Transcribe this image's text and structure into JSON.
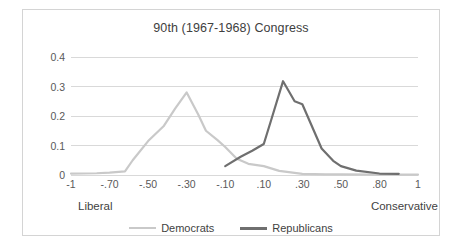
{
  "chart_data": {
    "type": "line",
    "title": "90th (1967-1968) Congress",
    "xlabel": "",
    "ylabel": "",
    "ylim": [
      0,
      0.4
    ],
    "ytick_labels": [
      "0.4",
      "0.3",
      "0.2",
      "0.1",
      "0"
    ],
    "ytick_values": [
      0.4,
      0.3,
      0.2,
      0.1,
      0
    ],
    "categories": [
      "-1",
      "-.70",
      "-.50",
      "-.30",
      "-.10",
      ".10",
      ".30",
      ".50",
      ".80",
      "1"
    ],
    "x": [
      -1,
      -0.7,
      -0.5,
      -0.3,
      -0.1,
      0.1,
      0.3,
      0.5,
      0.8,
      1
    ],
    "grid": "horizontal",
    "legend_position": "bottom",
    "annotations": {
      "left_pole": "Liberal",
      "right_pole": "Conservative"
    },
    "series": [
      {
        "name": "Democrats",
        "color": "#c9c9c9",
        "values": [
          0.005,
          0.008,
          0.115,
          0.28,
          0.095,
          0.03,
          0.004,
          0.002,
          0.001,
          0.001
        ],
        "points": [
          {
            "x": -1.0,
            "y": 0.005
          },
          {
            "x": -0.8,
            "y": 0.006
          },
          {
            "x": -0.7,
            "y": 0.008
          },
          {
            "x": -0.62,
            "y": 0.012
          },
          {
            "x": -0.58,
            "y": 0.05
          },
          {
            "x": -0.5,
            "y": 0.115
          },
          {
            "x": -0.42,
            "y": 0.165
          },
          {
            "x": -0.36,
            "y": 0.225
          },
          {
            "x": -0.3,
            "y": 0.28
          },
          {
            "x": -0.24,
            "y": 0.205
          },
          {
            "x": -0.2,
            "y": 0.15
          },
          {
            "x": -0.14,
            "y": 0.118
          },
          {
            "x": -0.1,
            "y": 0.095
          },
          {
            "x": -0.04,
            "y": 0.055
          },
          {
            "x": 0.02,
            "y": 0.038
          },
          {
            "x": 0.1,
            "y": 0.03
          },
          {
            "x": 0.18,
            "y": 0.014
          },
          {
            "x": 0.3,
            "y": 0.004
          },
          {
            "x": 0.42,
            "y": 0.002
          },
          {
            "x": 0.5,
            "y": 0.002
          },
          {
            "x": 0.8,
            "y": 0.001
          },
          {
            "x": 1.0,
            "y": 0.001
          }
        ]
      },
      {
        "name": "Republicans",
        "color": "#6f6f6f",
        "values": [
          null,
          null,
          null,
          null,
          0.03,
          0.105,
          0.24,
          0.03,
          0.005,
          null
        ],
        "points": [
          {
            "x": -0.1,
            "y": 0.03
          },
          {
            "x": -0.02,
            "y": 0.062
          },
          {
            "x": 0.04,
            "y": 0.082
          },
          {
            "x": 0.1,
            "y": 0.105
          },
          {
            "x": 0.14,
            "y": 0.19
          },
          {
            "x": 0.2,
            "y": 0.318
          },
          {
            "x": 0.26,
            "y": 0.25
          },
          {
            "x": 0.3,
            "y": 0.24
          },
          {
            "x": 0.4,
            "y": 0.09
          },
          {
            "x": 0.46,
            "y": 0.048
          },
          {
            "x": 0.5,
            "y": 0.03
          },
          {
            "x": 0.62,
            "y": 0.015
          },
          {
            "x": 0.8,
            "y": 0.005
          },
          {
            "x": 0.9,
            "y": 0.004
          }
        ]
      }
    ]
  },
  "legend": {
    "entries": [
      {
        "label": "Democrats"
      },
      {
        "label": "Republicans"
      }
    ]
  },
  "colors": {
    "democrats": "#c9c9c9",
    "republicans": "#6f6f6f",
    "gridline": "#d9d9d9",
    "frame": "#d4d4d4",
    "text": "#595959"
  }
}
